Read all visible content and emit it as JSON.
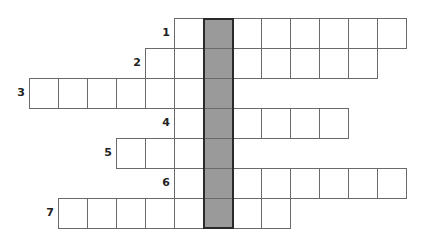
{
  "puzzle": {
    "type": "crossword",
    "cell_size": 29,
    "origin": {
      "x": 29,
      "y": 18
    },
    "shaded_column_x": 203,
    "colors": {
      "border": "#6a6a6a",
      "shaded": "#9a9a9a",
      "frame": "#2a2a2a"
    },
    "rows": [
      {
        "number": "1",
        "start_x": 174,
        "cells": 8
      },
      {
        "number": "2",
        "start_x": 145,
        "cells": 8
      },
      {
        "number": "3",
        "start_x": 29,
        "cells": 7
      },
      {
        "number": "4",
        "start_x": 174,
        "cells": 6
      },
      {
        "number": "5",
        "start_x": 116,
        "cells": 4
      },
      {
        "number": "6",
        "start_x": 174,
        "cells": 8
      },
      {
        "number": "7",
        "start_x": 58,
        "cells": 8
      }
    ]
  }
}
